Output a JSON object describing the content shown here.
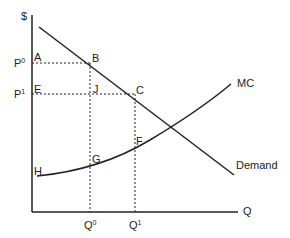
{
  "diagram": {
    "type": "supply-demand-economics",
    "axes": {
      "y_label": "$",
      "x_label": "Q"
    },
    "price_labels": [
      {
        "base": "P",
        "sup": "0"
      },
      {
        "base": "P",
        "sup": "1"
      }
    ],
    "quantity_labels": [
      {
        "base": "Q",
        "sup": "0"
      },
      {
        "base": "Q",
        "sup": "1"
      }
    ],
    "curves": {
      "demand": "Demand",
      "mc": "MC"
    },
    "points": {
      "A": "A",
      "B": "B",
      "E": "E",
      "J": "J",
      "C": "C",
      "F": "F",
      "G": "G",
      "H": "H"
    },
    "colors": {
      "line": "#222222",
      "background": "#ffffff"
    }
  }
}
